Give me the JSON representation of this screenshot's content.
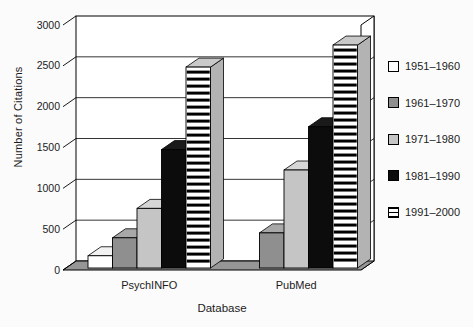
{
  "chart_data": {
    "type": "bar",
    "variant": "3d-grouped-bars",
    "title": "",
    "xlabel": "Database",
    "ylabel": "Number of Citations",
    "categories": [
      "PsychINFO",
      "PubMed"
    ],
    "series": [
      {
        "name": "1951–1960",
        "style": "white",
        "values": [
          150,
          0
        ]
      },
      {
        "name": "1961–1970",
        "style": "gray-dark",
        "values": [
          370,
          430
        ]
      },
      {
        "name": "1971–1980",
        "style": "gray-light",
        "values": [
          730,
          1200
        ]
      },
      {
        "name": "1981–1990",
        "style": "black",
        "values": [
          1450,
          1730
        ]
      },
      {
        "name": "1991–2000",
        "style": "striped",
        "values": [
          2460,
          2730
        ]
      }
    ],
    "ylim": [
      0,
      3000
    ],
    "ytick_step": 500,
    "yticks": [
      0,
      500,
      1000,
      1500,
      2000,
      2500,
      3000
    ],
    "grid": true,
    "legend_position": "right"
  },
  "styles": {
    "white": {
      "front": "#ffffff",
      "top": "#f2f2f2",
      "side": "#dcdcdc"
    },
    "gray-dark": {
      "front": "#8f8f8f",
      "top": "#a8a8a8",
      "side": "#6f6f6f"
    },
    "gray-light": {
      "front": "#c5c5c5",
      "top": "#d6d6d6",
      "side": "#a6a6a6"
    },
    "black": {
      "front": "#0c0c0c",
      "top": "#1a1a1a",
      "side": "#000000"
    },
    "striped": {
      "front": "#ffffff",
      "top": "#c9c9c9",
      "side": "#b3b3b3",
      "stripe": "#000000"
    }
  },
  "frame": {
    "wall_fill": "#ffffff",
    "floor_fill": "#969696",
    "line_color": "#000000",
    "text_color": "#1c1c1c"
  }
}
